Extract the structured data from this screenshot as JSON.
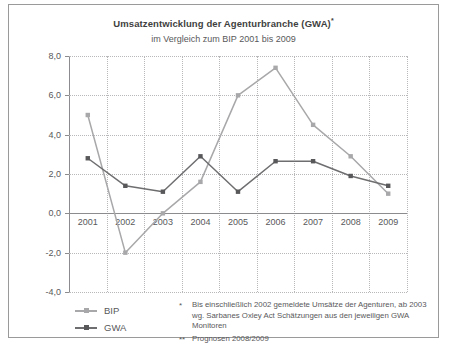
{
  "chart_data": {
    "type": "line",
    "title": "Umsatzentwicklung der Agenturbranche (GWA)",
    "title_marker": "*",
    "subtitle": "im Vergleich zum BIP 2001 bis 2009",
    "xlabel": "",
    "ylabel": "",
    "categories": [
      "2001",
      "2002",
      "2003",
      "2004",
      "2005",
      "2006",
      "2007",
      "2008",
      "2009"
    ],
    "ylim": [
      -4.0,
      8.0
    ],
    "yticks": [
      8.0,
      6.0,
      4.0,
      2.0,
      0.0,
      -2.0,
      -4.0
    ],
    "ytick_labels": [
      "8,0",
      "6,0",
      "4,0",
      "2,0",
      "0,0",
      "-2,0",
      "-4,0"
    ],
    "grid": true,
    "legend_position": "bottom-left",
    "series": [
      {
        "name": "BIP",
        "color": "#a8a8aa",
        "values": [
          5.0,
          -2.0,
          0.0,
          1.6,
          6.0,
          7.4,
          4.5,
          2.9,
          1.0
        ]
      },
      {
        "name": "GWA",
        "color": "#6e6e70",
        "values": [
          2.8,
          1.4,
          1.1,
          2.9,
          1.1,
          2.65,
          2.65,
          1.9,
          1.4
        ]
      }
    ]
  },
  "legend": {
    "items": [
      {
        "label": "BIP"
      },
      {
        "label": "GWA"
      }
    ]
  },
  "notes": [
    {
      "marker": "*",
      "line1": "Bis einschließlich 2002 gemeldete Umsätze der Agenturen, ab 2003",
      "line2": "wg. Sarbanes Oxley Act Schätzungen aus den jeweiligen GWA Monitoren"
    },
    {
      "marker": "**",
      "line1": "Prognosen 2008/2009",
      "line2": ""
    }
  ],
  "colors": {
    "bip": "#a8a8aa",
    "gwa": "#6e6e70",
    "axis": "#8c8c8e",
    "grid": "#b8b8ba",
    "text": "#58585a",
    "frame": "#9a9a9a"
  }
}
